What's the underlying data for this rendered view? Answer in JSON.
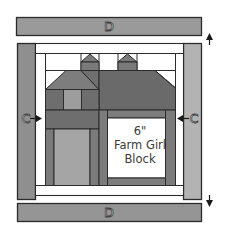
{
  "diagram": {
    "title_lines": [
      "6\"",
      "Farm Girl",
      "Block"
    ],
    "border_labels": {
      "top": "D",
      "bottom": "D",
      "left": "C",
      "right": "C"
    },
    "arrows": {
      "left_side": "→",
      "right_side": "←",
      "top_right": "↑",
      "bottom_right": "↓"
    },
    "colors": {
      "background": "#ffffff",
      "outline": "#2b2b2b",
      "border_d": "#9a9a9a",
      "border_c_left": "#8f8f8f",
      "border_c_right": "#b3b3b3",
      "sashing_white": "#ffffff",
      "roof_left": "#7d7d7d",
      "roof_right": "#6a6a6a",
      "chimney": "#7a7a7a",
      "wall_dark": "#6e6e6e",
      "window_light": "#9d9d9d",
      "door_light": "#a5a5a5",
      "door_frame": "#7b7b7b",
      "center_panel": "#ffffff"
    }
  }
}
